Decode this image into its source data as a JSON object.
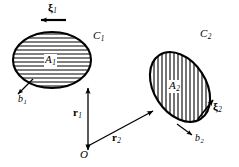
{
  "figure": {
    "background_color": "#ffffff",
    "stroke_color": "#000000",
    "width": 239,
    "height": 167
  },
  "regions": [
    {
      "id": "region-1",
      "area_label": "A",
      "area_subscript": "1",
      "contour_label": "C",
      "contour_subscript": "1",
      "thickness_label": "b",
      "thickness_subscript": "1",
      "hatch_direction": "horizontal",
      "center_x": 52,
      "center_y": 60,
      "radius_x": 39,
      "radius_y": 28,
      "rotation_deg": 0
    },
    {
      "id": "region-2",
      "area_label": "A",
      "area_subscript": "2",
      "contour_label": "C",
      "contour_subscript": "2",
      "thickness_label": "b",
      "thickness_subscript": "2",
      "hatch_direction": "vertical",
      "center_x": 180,
      "center_y": 87,
      "radius_x": 26,
      "radius_y": 38,
      "rotation_deg": -33
    }
  ],
  "vectors": [
    {
      "id": "vector-r1",
      "label": "r",
      "subscript": "1",
      "from": "O",
      "to": "region-1",
      "x1": 88,
      "y1": 146,
      "x2": 88,
      "y2": 87
    },
    {
      "id": "vector-r2",
      "label": "r",
      "subscript": "2",
      "from": "O",
      "to": "region-2",
      "x1": 88,
      "y1": 146,
      "x2": 152,
      "y2": 112
    }
  ],
  "direction_markers": [
    {
      "id": "xi-1",
      "label": "ξ",
      "subscript": "1",
      "direction": "left",
      "arrow_x1": 65,
      "arrow_y1": 20,
      "arrow_x2": 41,
      "arrow_y2": 20
    },
    {
      "id": "xi-2",
      "label": "ξ",
      "subscript": "2",
      "direction": "up-right",
      "arrow_x1": 199,
      "arrow_y1": 118,
      "arrow_x2": 214,
      "arrow_y2": 100
    }
  ],
  "thickness_markers": [
    {
      "id": "b-1",
      "label": "b",
      "subscript": "1",
      "direction": "down-left",
      "arrow_x1": 32,
      "arrow_y1": 80,
      "arrow_x2": 18,
      "arrow_y2": 94
    },
    {
      "id": "b-2",
      "label": "b",
      "subscript": "2",
      "direction": "down-right",
      "arrow_x1": 178,
      "arrow_y1": 125,
      "arrow_x2": 193,
      "arrow_y2": 136
    }
  ],
  "origin": {
    "label": "O",
    "x": 88,
    "y": 146
  },
  "labels": {
    "c1": {
      "text": "C",
      "sub": "1"
    },
    "a1": {
      "text": "A",
      "sub": "1"
    },
    "b1": {
      "text": "b",
      "sub": "1"
    },
    "c2": {
      "text": "C",
      "sub": "2"
    },
    "a2": {
      "text": "A",
      "sub": "2"
    },
    "b2": {
      "text": "b",
      "sub": "2"
    },
    "r1": {
      "text": "r",
      "sub": "1"
    },
    "r2": {
      "text": "r",
      "sub": "2"
    },
    "xi1": {
      "text": "ξ",
      "sub": "1"
    },
    "xi2": {
      "text": "ξ",
      "sub": "2"
    },
    "origin": {
      "text": "O"
    }
  }
}
